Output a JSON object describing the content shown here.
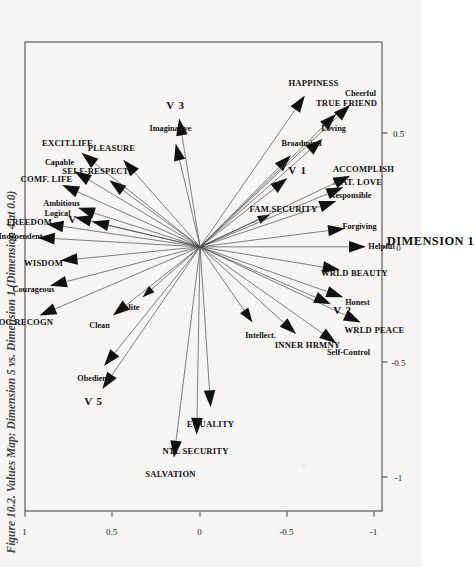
{
  "figure": {
    "caption": "Figure 10.2. Values Map: Dimension 5 vs. Dimension 1 (Dimension 4 at 0.0)"
  },
  "chart_data": {
    "type": "scatter",
    "title": "Figure 10.2. Values Map: Dimension 5 vs. Dimension 1 (Dimension 4 at 0.0)",
    "xlabel": "DIMENSION 1",
    "ylabel": "DIMENSION 5",
    "xlim": [
      -1.15,
      0.9
    ],
    "ylim": [
      -1.05,
      1.0
    ],
    "xticks": [
      "-1",
      "-0.5",
      "0",
      "0.5"
    ],
    "xtick_values": [
      -1,
      -0.5,
      0,
      0.5
    ],
    "yticks": [
      "1",
      "0.5",
      "0",
      "-0.5",
      "-1"
    ],
    "ytick_values": [
      1,
      0.5,
      0,
      -0.5,
      -1
    ],
    "grid": false,
    "legend": null,
    "origin": [
      0,
      0
    ],
    "note": "Vector (biplot) map; every value is drawn as an arrow from the origin to its coordinate.",
    "vectors": [
      {
        "label": "SOC RECOGN",
        "style": "caps",
        "x": -0.3,
        "y": 0.92
      },
      {
        "label": "Courageous",
        "style": "low",
        "x": -0.17,
        "y": 0.86
      },
      {
        "label": "WISDOM",
        "style": "caps",
        "x": -0.06,
        "y": 0.8
      },
      {
        "label": "Independent",
        "style": "low",
        "x": 0.04,
        "y": 0.93
      },
      {
        "label": "FREEDOM",
        "style": "caps",
        "x": 0.1,
        "y": 0.88
      },
      {
        "label": "Logical",
        "style": "low",
        "x": 0.13,
        "y": 0.72
      },
      {
        "label": "Ambitious",
        "style": "low",
        "x": 0.17,
        "y": 0.7
      },
      {
        "label": "V 4",
        "style": "vnum",
        "x": 0.11,
        "y": 0.62
      },
      {
        "label": "COMF. LIFE",
        "style": "caps",
        "x": 0.27,
        "y": 0.79
      },
      {
        "label": "Capable",
        "style": "low",
        "x": 0.33,
        "y": 0.72
      },
      {
        "label": "SELF-RESPECT",
        "style": "caps",
        "x": 0.29,
        "y": 0.52
      },
      {
        "label": "EXCIT.LIFE",
        "style": "caps",
        "x": 0.41,
        "y": 0.68
      },
      {
        "label": "PLEASURE",
        "style": "caps",
        "x": 0.38,
        "y": 0.44
      },
      {
        "label": "Obedient",
        "style": "low",
        "x": -0.52,
        "y": 0.55
      },
      {
        "label": "Clean",
        "style": "low",
        "x": -0.3,
        "y": 0.5
      },
      {
        "label": "Polite",
        "style": "low",
        "x": -0.22,
        "y": 0.33
      },
      {
        "label": "V 5",
        "style": "vnum",
        "x": -0.62,
        "y": 0.56
      },
      {
        "label": "SALVATION",
        "style": "caps",
        "x": -0.92,
        "y": 0.15
      },
      {
        "label": "NTL SECURITY",
        "style": "caps",
        "x": -0.82,
        "y": 0.02
      },
      {
        "label": "EQUALITY",
        "style": "caps",
        "x": -0.7,
        "y": -0.06
      },
      {
        "label": "Imaginative",
        "style": "low",
        "x": 0.45,
        "y": 0.14
      },
      {
        "label": "V 3",
        "style": "vnum",
        "x": 0.56,
        "y": 0.12
      },
      {
        "label": "Intellect.",
        "style": "low",
        "x": -0.33,
        "y": -0.3
      },
      {
        "label": "INNER HRMNY",
        "style": "caps",
        "x": -0.38,
        "y": -0.55
      },
      {
        "label": "Self-Control",
        "style": "low",
        "x": -0.42,
        "y": -0.78
      },
      {
        "label": "WRLD PEACE",
        "style": "caps",
        "x": -0.33,
        "y": -0.92
      },
      {
        "label": "V 2",
        "style": "vnum",
        "x": -0.25,
        "y": -0.75
      },
      {
        "label": "Honest",
        "style": "low",
        "x": -0.22,
        "y": -0.82
      },
      {
        "label": "WRLD BEAUTY",
        "style": "caps",
        "x": -0.1,
        "y": -0.8
      },
      {
        "label": "Helpful",
        "style": "low",
        "x": 0.0,
        "y": -0.95
      },
      {
        "label": "Forgiving",
        "style": "low",
        "x": 0.08,
        "y": -0.83
      },
      {
        "label": "FAM.SECURITY",
        "style": "caps",
        "x": 0.14,
        "y": -0.4
      },
      {
        "label": "Responsible",
        "style": "low",
        "x": 0.2,
        "y": -0.78
      },
      {
        "label": "MAT. LOVE",
        "style": "caps",
        "x": 0.26,
        "y": -0.82
      },
      {
        "label": "ACCOMPLISH",
        "style": "caps",
        "x": 0.31,
        "y": -0.86
      },
      {
        "label": "V 1",
        "style": "vnum",
        "x": 0.3,
        "y": -0.5
      },
      {
        "label": "Broadmind",
        "style": "low",
        "x": 0.4,
        "y": -0.52
      },
      {
        "label": "Loving",
        "style": "low",
        "x": 0.47,
        "y": -0.7
      },
      {
        "label": "TRUE FRIEND",
        "style": "caps",
        "x": 0.58,
        "y": -0.78
      },
      {
        "label": "Cheerful",
        "style": "low",
        "x": 0.62,
        "y": -0.86
      },
      {
        "label": "HAPPINESS",
        "style": "caps",
        "x": 0.66,
        "y": -0.6
      }
    ]
  }
}
